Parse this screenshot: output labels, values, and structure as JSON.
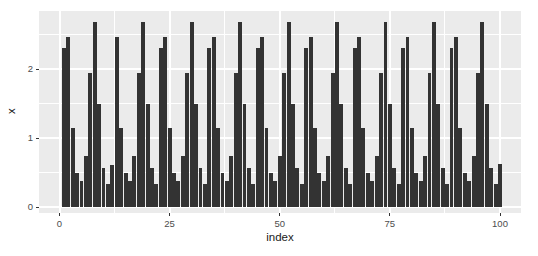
{
  "chart_data": {
    "type": "bar",
    "title": "",
    "xlabel": "index",
    "ylabel": "x",
    "x_ticks": [
      0,
      25,
      50,
      75,
      100
    ],
    "y_ticks": [
      0,
      1,
      2
    ],
    "xlim": [
      -4.6,
      104.6
    ],
    "ylim": [
      -0.16,
      2.86
    ],
    "grid": "on",
    "legend": "none",
    "panel_bg": "#EBEBEB",
    "grid_color": "#FFFFFF",
    "bar_color": "#333333",
    "tick_label_color": "#4D4D4D",
    "x": [
      1,
      2,
      3,
      4,
      5,
      6,
      7,
      8,
      9,
      10,
      11,
      12,
      13,
      14,
      15,
      16,
      17,
      18,
      19,
      20,
      21,
      22,
      23,
      24,
      25,
      26,
      27,
      28,
      29,
      30,
      31,
      32,
      33,
      34,
      35,
      36,
      37,
      38,
      39,
      40,
      41,
      42,
      43,
      44,
      45,
      46,
      47,
      48,
      49,
      50,
      51,
      52,
      53,
      54,
      55,
      56,
      57,
      58,
      59,
      60,
      61,
      62,
      63,
      64,
      65,
      66,
      67,
      68,
      69,
      70,
      71,
      72,
      73,
      74,
      75,
      76,
      77,
      78,
      79,
      80,
      81,
      82,
      83,
      84,
      85,
      86,
      87,
      88,
      89,
      90,
      91,
      92,
      93,
      94,
      95,
      96,
      97,
      98,
      99,
      100
    ],
    "values": [
      2.3,
      2.46,
      1.14,
      0.49,
      0.37,
      0.74,
      1.94,
      2.68,
      1.49,
      0.56,
      0.34,
      0.61,
      2.46,
      1.14,
      0.49,
      0.37,
      0.74,
      1.94,
      2.68,
      1.49,
      0.56,
      0.34,
      2.3,
      2.46,
      1.14,
      0.49,
      0.37,
      0.74,
      1.94,
      2.68,
      1.49,
      0.56,
      0.34,
      2.3,
      2.46,
      1.14,
      0.49,
      0.37,
      0.74,
      1.94,
      2.68,
      1.49,
      0.56,
      0.34,
      2.3,
      2.46,
      1.14,
      0.49,
      0.37,
      0.74,
      1.94,
      2.68,
      1.49,
      0.56,
      0.34,
      2.3,
      2.46,
      1.14,
      0.49,
      0.37,
      0.74,
      1.94,
      2.68,
      1.49,
      0.56,
      0.34,
      2.3,
      2.46,
      1.14,
      0.49,
      0.37,
      0.74,
      1.94,
      2.68,
      1.49,
      0.56,
      0.34,
      2.3,
      2.46,
      1.14,
      0.49,
      0.37,
      0.74,
      1.94,
      2.68,
      1.49,
      0.56,
      0.34,
      2.3,
      2.46,
      1.14,
      0.49,
      0.37,
      0.74,
      1.94,
      2.68,
      1.49,
      0.56,
      0.34,
      0.63
    ]
  }
}
